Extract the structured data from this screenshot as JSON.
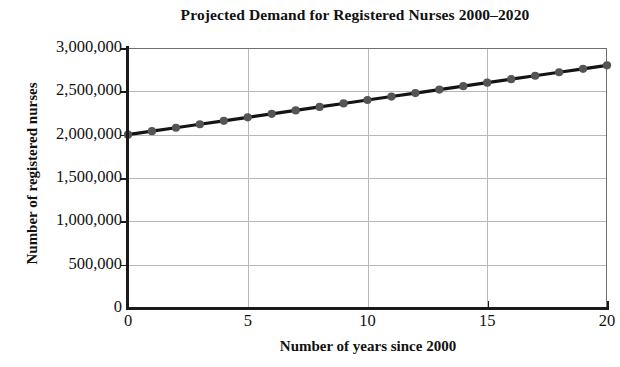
{
  "chart_data": {
    "type": "line",
    "title": "Projected Demand for Registered Nurses 2000–2020",
    "xlabel": "Number of years since 2000",
    "ylabel": "Number of registered nurses",
    "xlim": [
      0,
      20
    ],
    "ylim": [
      0,
      3000000
    ],
    "grid": true,
    "legend": "none",
    "marker": "circle",
    "x": [
      0,
      1,
      2,
      3,
      4,
      5,
      6,
      7,
      8,
      9,
      10,
      11,
      12,
      13,
      14,
      15,
      16,
      17,
      18,
      19,
      20
    ],
    "values": [
      2000000,
      2040000,
      2080000,
      2120000,
      2160000,
      2200000,
      2240000,
      2280000,
      2320000,
      2360000,
      2400000,
      2440000,
      2480000,
      2520000,
      2560000,
      2600000,
      2640000,
      2680000,
      2720000,
      2760000,
      2800000
    ],
    "xticks": [
      0,
      5,
      10,
      15,
      20
    ],
    "xtick_labels": [
      "0",
      "5",
      "10",
      "15",
      "20"
    ],
    "yticks": [
      0,
      500000,
      1000000,
      1500000,
      2000000,
      2500000,
      3000000
    ],
    "ytick_labels": [
      "0",
      "500,000",
      "1,000,000",
      "1,500,000",
      "2,000,000",
      "2,500,000",
      "3,000,000"
    ],
    "colors": {
      "line": "#141414",
      "marker": "#555555",
      "grid": "#b8b8b8",
      "axis": "#1a1a1a",
      "background": "#ffffff",
      "text": "#111111"
    }
  }
}
